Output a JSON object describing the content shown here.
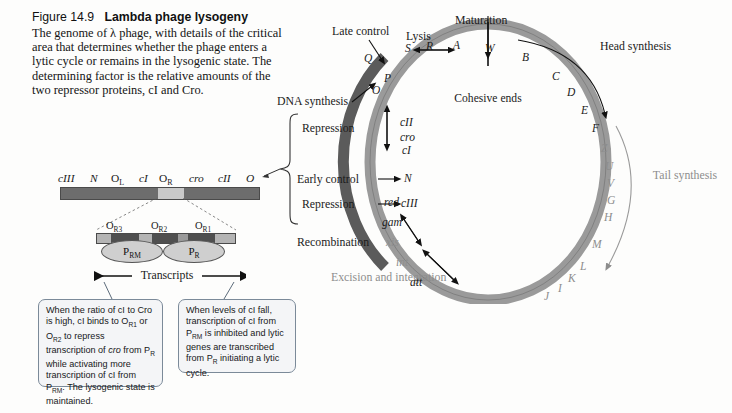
{
  "caption": {
    "figure_number": "Figure 14.9",
    "figure_title": "Lambda phage lysogeny",
    "body": "The genome of λ phage, with details of the critical area that determines whether the phage enters a lytic cycle or remains in the lysogenic state. The determining factor is the relative amounts of the two repressor proteins, cI and Cro."
  },
  "gene_map": {
    "genes": [
      "cIII",
      "N",
      "OL",
      "cI",
      "OR",
      "cro",
      "cII",
      "O"
    ],
    "gene_labels": [
      {
        "text": "cIII",
        "italic": true
      },
      {
        "text": "N",
        "italic": true
      },
      {
        "text": "O",
        "sub": "L",
        "italic": false
      },
      {
        "text": "cI",
        "italic": true
      },
      {
        "text": "O",
        "sub": "R",
        "italic": false
      },
      {
        "text": "cro",
        "italic": true
      },
      {
        "text": "cII",
        "italic": true
      },
      {
        "text": "O",
        "italic": true
      }
    ],
    "bar_color": "#6d6d6d",
    "highlight_color": "#c9c9c9"
  },
  "operator_detail": {
    "operators": [
      {
        "text": "O",
        "sub": "R3"
      },
      {
        "text": "O",
        "sub": "R2"
      },
      {
        "text": "O",
        "sub": "R1"
      }
    ],
    "promoters": [
      {
        "text": "P",
        "sub": "RM"
      },
      {
        "text": "P",
        "sub": "R"
      }
    ],
    "transcripts_label": "Transcripts",
    "block_colors": [
      "#b4b4b4",
      "#4f4f4f",
      "#b4b4b4",
      "#4f4f4f",
      "#9a9a9a",
      "#4f4f4f",
      "#b4b4b4"
    ]
  },
  "callouts": [
    {
      "id": "lysogenic-callout",
      "html": "When the ratio of cI to Cro is high, cI binds to O<sub>R1</sub> or O<sub>R2</sub> to repress transcription of <i>cro</i> from P<sub>R</sub> while activating more transcription of cI from P<sub>RM</sub>. The lysogenic state is maintained.",
      "text": "When the ratio of cI to Cro is high, cI binds to OR1 or OR2 to repress transcription of cro from PR while activating more transcription of cI from PRM. The lysogenic state is maintained."
    },
    {
      "id": "lytic-callout",
      "html": "When levels of cI fall, transcription of cI from P<sub>RM</sub> is inhibited and lytic genes are transcribed from P<sub>R</sub> initiating a lytic cycle.",
      "text": "When levels of cI fall, transcription of cI from PRM is inhibited and lytic genes are transcribed from PR initiating a lytic cycle."
    }
  ],
  "circular_map": {
    "center_label": "Cohesive ends",
    "ring_color": "#9a9a9a",
    "ring_dark_color": "#5b5b5b",
    "function_labels": [
      {
        "name": "maturation",
        "text": "Maturation"
      },
      {
        "name": "lysis",
        "text": "Lysis"
      },
      {
        "name": "late-control",
        "text": "Late control"
      },
      {
        "name": "head-synthesis",
        "text": "Head synthesis"
      },
      {
        "name": "tail-synthesis",
        "text": "Tail synthesis"
      },
      {
        "name": "dna-synthesis",
        "text": "DNA synthesis"
      },
      {
        "name": "repression-upper",
        "text": "Repression"
      },
      {
        "name": "early-control",
        "text": "Early control"
      },
      {
        "name": "repression-lower",
        "text": "Repression"
      },
      {
        "name": "recombination",
        "text": "Recombination"
      },
      {
        "name": "excision-integration",
        "text": "Excision and integration"
      }
    ],
    "genes": [
      {
        "text": "Q",
        "faded": false
      },
      {
        "text": "S",
        "faded": false
      },
      {
        "text": "R",
        "faded": false
      },
      {
        "text": "A",
        "faded": false
      },
      {
        "text": "W",
        "faded": false
      },
      {
        "text": "B",
        "faded": false
      },
      {
        "text": "C",
        "faded": false
      },
      {
        "text": "D",
        "faded": false
      },
      {
        "text": "E",
        "faded": false
      },
      {
        "text": "F",
        "faded": false
      },
      {
        "text": "Z",
        "faded": true
      },
      {
        "text": "U",
        "faded": true
      },
      {
        "text": "V",
        "faded": true
      },
      {
        "text": "G",
        "faded": true
      },
      {
        "text": "H",
        "faded": true
      },
      {
        "text": "M",
        "faded": true
      },
      {
        "text": "L",
        "faded": true
      },
      {
        "text": "K",
        "faded": true
      },
      {
        "text": "I",
        "faded": true
      },
      {
        "text": "J",
        "faded": true
      },
      {
        "text": "att",
        "faded": false
      },
      {
        "text": "int",
        "faded": false
      },
      {
        "text": "xis",
        "faded": false
      },
      {
        "text": "gam",
        "faded": false
      },
      {
        "text": "red",
        "faded": false
      },
      {
        "text": "cIII",
        "faded": false
      },
      {
        "text": "N",
        "faded": false
      },
      {
        "text": "cI",
        "faded": false
      },
      {
        "text": "cro",
        "faded": false
      },
      {
        "text": "cII",
        "faded": false
      },
      {
        "text": "O",
        "faded": false
      },
      {
        "text": "P",
        "faded": false
      }
    ]
  }
}
